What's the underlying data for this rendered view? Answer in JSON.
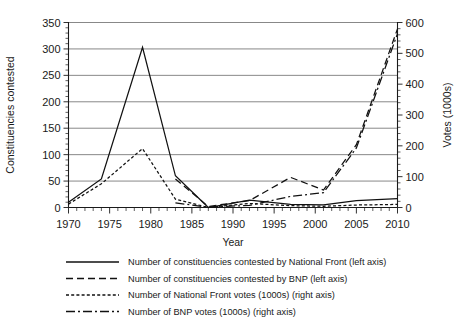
{
  "chart_data": {
    "type": "line",
    "title": "",
    "subtitle": "",
    "xlabel": "Year",
    "ylabel": "Constituencies contested",
    "y2label": "Votes (1000s)",
    "xlim": [
      1970,
      2010
    ],
    "ylim": [
      0,
      350
    ],
    "y2lim": [
      0,
      600
    ],
    "xticks": [
      1970,
      1975,
      1980,
      1985,
      1990,
      1995,
      2000,
      2005,
      2010
    ],
    "xtick_labels": [
      "1970",
      "1975",
      "1980",
      "1985",
      "1990",
      "1995",
      "2000",
      "2005",
      "2010"
    ],
    "x_minor_step": 1,
    "yticks": [
      0,
      50,
      100,
      150,
      200,
      250,
      300,
      350
    ],
    "ytick_labels": [
      "0",
      "50",
      "100",
      "150",
      "200",
      "250",
      "300",
      "350"
    ],
    "y_minor_step": 10,
    "y2ticks": [
      0,
      100,
      200,
      300,
      400,
      500,
      600
    ],
    "y2tick_labels": [
      "0",
      "100",
      "200",
      "300",
      "400",
      "500",
      "600"
    ],
    "y2_minor_step": 20,
    "grid": true,
    "grid_axis": "y",
    "legend_position": "below",
    "series": [
      {
        "name": "Number of constituencies contested by National Front (left axis)",
        "axis": "left",
        "style": "solid",
        "dash": "none",
        "color": "#111111",
        "x": [
          1970,
          1974,
          1979,
          1983,
          1987,
          1992,
          1997,
          2001,
          2005,
          2010
        ],
        "values": [
          10,
          54,
          303,
          60,
          0,
          14,
          6,
          5,
          13,
          17
        ]
      },
      {
        "name": "Number of constituencies contested by BNP (left axis)",
        "axis": "left",
        "style": "dashed",
        "dash": "7,4",
        "color": "#111111",
        "x": [
          1983,
          1987,
          1992,
          1997,
          2001,
          2005,
          2010
        ],
        "values": [
          54,
          2,
          13,
          57,
          33,
          119,
          338
        ]
      },
      {
        "name": "Number of National Front votes (1000s) (right axis)",
        "axis": "right",
        "style": "dotted",
        "dash": "3,2.2",
        "color": "#111111",
        "x": [
          1970,
          1974,
          1979,
          1983,
          1987,
          1992,
          1997,
          2001,
          2005,
          2010
        ],
        "values": [
          11,
          77,
          191,
          27,
          0,
          13,
          6,
          4,
          8,
          10
        ]
      },
      {
        "name": "Number of BNP votes (1000s) (right axis)",
        "axis": "right",
        "style": "dashdot",
        "dash": "9,3,2,3",
        "color": "#111111",
        "x": [
          1983,
          1987,
          1992,
          1997,
          2001,
          2005,
          2010
        ],
        "values": [
          15,
          1,
          7,
          36,
          48,
          193,
          564
        ]
      }
    ],
    "legend_entries": [
      {
        "label": "Number of constituencies contested by National Front (left axis)",
        "style": "solid",
        "dash": "none"
      },
      {
        "label": "Number of constituencies contested by BNP (left axis)",
        "style": "dashed",
        "dash": "7,4"
      },
      {
        "label": "Number of National Front votes (1000s) (right axis)",
        "style": "dotted",
        "dash": "3,2.2"
      },
      {
        "label": "Number of BNP votes (1000s) (right axis)",
        "style": "dashdot",
        "dash": "9,3,2,3"
      }
    ]
  }
}
